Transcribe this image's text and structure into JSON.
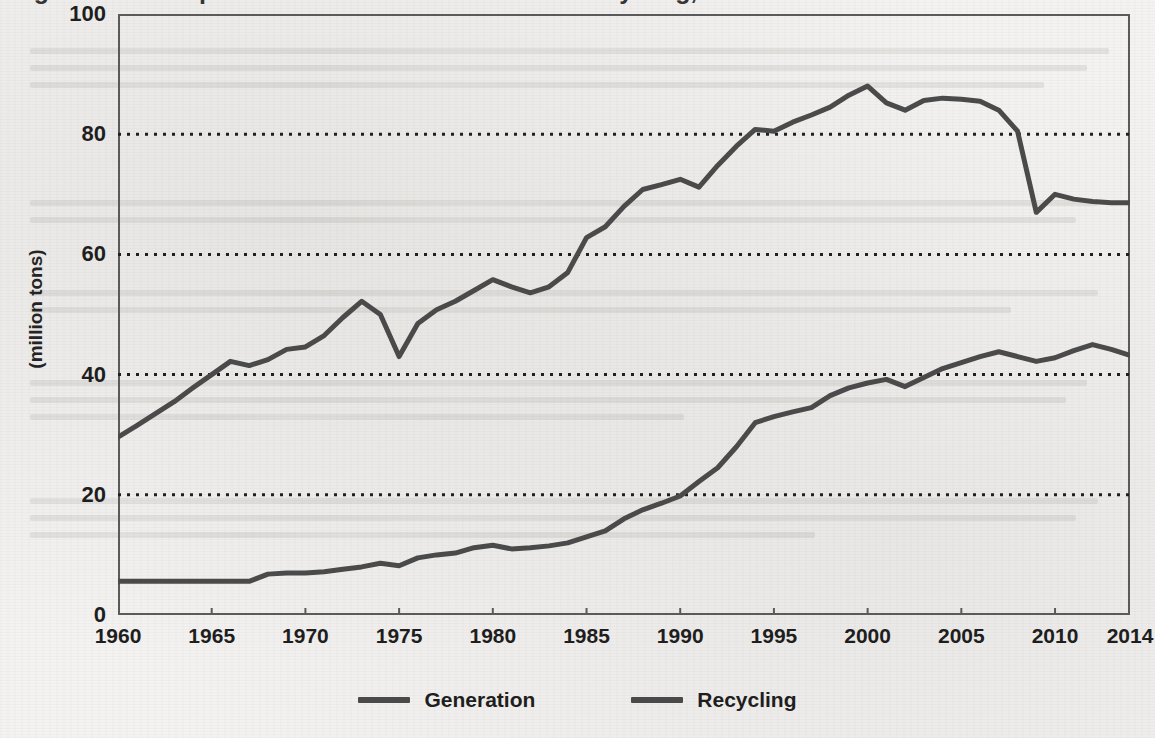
{
  "chart_data": {
    "type": "line",
    "title": "Figure 1. Municipal Solid Waste Generation and Recycling, 1960 to 2014",
    "xlabel": "",
    "ylabel": "(million tons)",
    "ylim": [
      0,
      100
    ],
    "xlim": [
      1960,
      2014
    ],
    "yticks": [
      "0",
      "20",
      "40",
      "60",
      "80",
      "100"
    ],
    "ytick_values": [
      0,
      20,
      40,
      60,
      80,
      100
    ],
    "xticks": [
      "1960",
      "1965",
      "1970",
      "1975",
      "1980",
      "1985",
      "1990",
      "1995",
      "2000",
      "2005",
      "2010",
      "2014"
    ],
    "xtick_values": [
      1960,
      1965,
      1970,
      1975,
      1980,
      1985,
      1990,
      1995,
      2000,
      2005,
      2010,
      2014
    ],
    "grid": "horizontal-dotted",
    "legend_position": "bottom-center",
    "line_color": "#4a4a4a",
    "frame_color": "#5a5a5a",
    "background": "#f4f3f1",
    "x": [
      1960,
      1961,
      1962,
      1963,
      1964,
      1965,
      1966,
      1967,
      1968,
      1969,
      1970,
      1971,
      1972,
      1973,
      1974,
      1975,
      1976,
      1977,
      1978,
      1979,
      1980,
      1981,
      1982,
      1983,
      1984,
      1985,
      1986,
      1987,
      1988,
      1989,
      1990,
      1991,
      1992,
      1993,
      1994,
      1995,
      1996,
      1997,
      1998,
      1999,
      2000,
      2001,
      2002,
      2003,
      2004,
      2005,
      2006,
      2007,
      2008,
      2009,
      2010,
      2011,
      2012,
      2013,
      2014
    ],
    "series": [
      {
        "name": "Generation",
        "color": "#4a4a4a",
        "values": [
          29.6,
          31.5,
          33.5,
          35.5,
          37.8,
          40.0,
          42.2,
          41.5,
          42.5,
          44.2,
          44.6,
          46.5,
          49.5,
          52.2,
          50.0,
          43.0,
          48.5,
          50.8,
          52.2,
          54.0,
          55.8,
          54.6,
          53.6,
          54.6,
          57.0,
          62.8,
          64.6,
          68.0,
          70.8,
          71.6,
          72.5,
          71.2,
          74.8,
          78.0,
          80.8,
          80.5,
          82.0,
          83.2,
          84.5,
          86.5,
          88.0,
          85.2,
          84.0,
          85.6,
          86.0,
          85.8,
          85.5,
          84.0,
          80.5,
          67.0,
          70.0,
          69.2,
          68.8,
          68.6,
          68.6
        ]
      },
      {
        "name": "Recycling",
        "color": "#4a4a4a",
        "values": [
          5.6,
          5.6,
          5.6,
          5.6,
          5.6,
          5.6,
          5.6,
          5.6,
          6.8,
          7.0,
          7.0,
          7.2,
          7.6,
          8.0,
          8.6,
          8.2,
          9.5,
          10.0,
          10.3,
          11.2,
          11.6,
          11.0,
          11.2,
          11.5,
          12.0,
          13.0,
          14.0,
          16.0,
          17.5,
          18.6,
          19.8,
          22.2,
          24.5,
          28.0,
          32.0,
          33.0,
          33.8,
          34.5,
          36.5,
          37.8,
          38.6,
          39.2,
          38.0,
          39.5,
          41.0,
          42.0,
          43.0,
          43.8,
          43.0,
          42.2,
          42.8,
          44.0,
          45.0,
          44.2,
          43.2
        ]
      }
    ]
  },
  "legend": {
    "items": [
      {
        "label": "Generation"
      },
      {
        "label": "Recycling"
      }
    ]
  },
  "axes": {
    "y_title": "(million tons)"
  }
}
